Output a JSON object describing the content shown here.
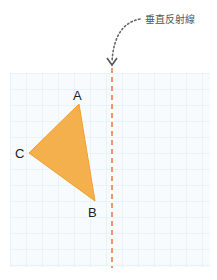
{
  "diagram": {
    "annotation_label": "垂直反射線",
    "vertices": {
      "A": {
        "label": "A",
        "x": 79,
        "y": 104
      },
      "B": {
        "label": "B",
        "x": 95,
        "y": 201
      },
      "C": {
        "label": "C",
        "x": 29,
        "y": 153
      }
    },
    "colors": {
      "triangle_fill": "#f4b04c",
      "reflection_line": "#f08a5d",
      "grid_line": "#dcecf5",
      "grid_bg": "#f7fbfd",
      "annotation_arrow": "#666666"
    },
    "grid": {
      "x": 10,
      "y": 73,
      "width": 200,
      "height": 194,
      "cell": 16
    },
    "reflection_line_x": 112
  }
}
